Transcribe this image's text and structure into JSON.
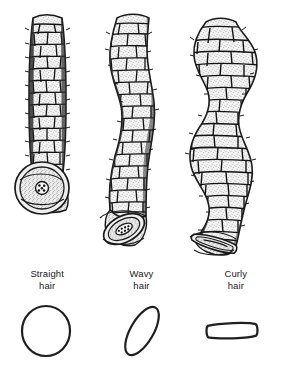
{
  "figure": {
    "background_color": "#ffffff",
    "ink_color": "#1a1a1a",
    "fill_color": "#efefef",
    "columns": [
      {
        "id": "straight",
        "label_line1": "Straight",
        "label_line2": "hair",
        "shaft_shape": "straight",
        "cross_section_shape": "circle",
        "cross_section_name": "round-cross-section",
        "medulla": "central round cluster of cells"
      },
      {
        "id": "wavy",
        "label_line1": "Wavy",
        "label_line2": "hair",
        "shaft_shape": "wavy",
        "cross_section_shape": "ellipse",
        "cross_section_name": "oval-cross-section",
        "medulla": "elongated cluster of cells"
      },
      {
        "id": "curly",
        "label_line1": "Curly",
        "label_line2": "hair",
        "shaft_shape": "curly",
        "cross_section_shape": "flattened-ribbon",
        "cross_section_name": "flat-cross-section",
        "medulla": "flattened slit"
      }
    ]
  }
}
